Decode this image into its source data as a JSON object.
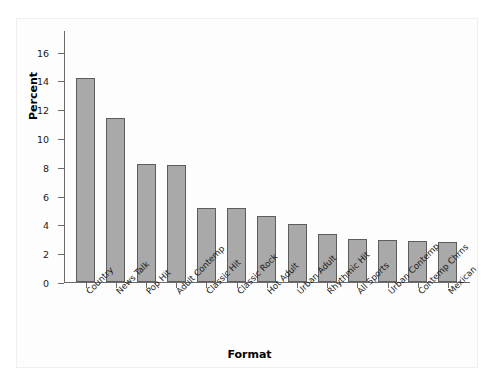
{
  "chart_data": {
    "type": "bar",
    "title": "",
    "xlabel": "Format",
    "ylabel": "Percent",
    "categories": [
      "Country",
      "News Talk",
      "Pop Hit",
      "Adult Contemp",
      "Classic Hit",
      "Classic Rock",
      "Hot Adult",
      "Urban Adult",
      "Rhythmic Hit",
      "All Sports",
      "Urban Contemp",
      "Contemp Chrns",
      "Mexican"
    ],
    "values": [
      14.2,
      11.4,
      8.2,
      8.1,
      5.15,
      5.15,
      4.6,
      4.0,
      3.35,
      3.0,
      2.95,
      2.85,
      2.8
    ],
    "ylim": [
      0,
      17.5
    ],
    "yticks": [
      0,
      2,
      4,
      6,
      8,
      10,
      12,
      14,
      16
    ],
    "ytick_labels": [
      "0",
      "2",
      "4",
      "6",
      "8",
      "10",
      "12",
      "14",
      "16"
    ],
    "grid": false,
    "legend": false,
    "bar_color": "#a9a9a9",
    "bar_edge_color": "#5d5d5d",
    "axis_color": "#6b6b6b"
  }
}
